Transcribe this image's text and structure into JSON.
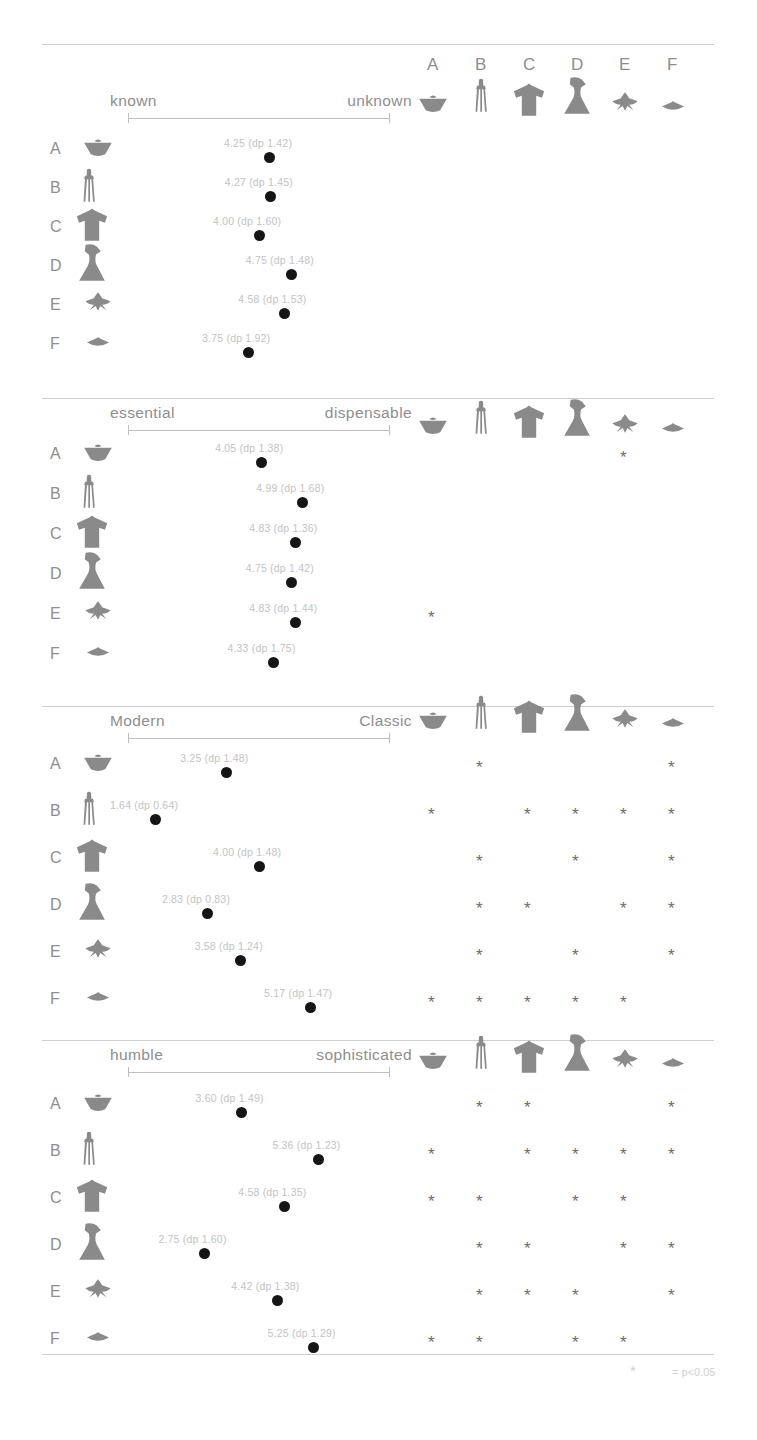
{
  "figure": {
    "categories": [
      "A",
      "B",
      "C",
      "D",
      "E",
      "F"
    ],
    "icon_names": [
      "bowl-silhouette",
      "juicer-silhouette",
      "tshirt-silhouette",
      "hourglass-silhouette",
      "bird-silhouette",
      "disc-silhouette"
    ],
    "footnote": "= p<0.05",
    "footnote_marker": "*",
    "significance_marker": "*"
  },
  "chart_data": {
    "type": "scatter",
    "title": "",
    "categories": [
      "A",
      "B",
      "C",
      "D",
      "E",
      "F"
    ],
    "xlim": [
      1,
      7
    ],
    "grid": false,
    "legend": "none",
    "panels": [
      {
        "id": "panel-known-unknown",
        "xlabel_left": "known",
        "xlabel_right": "unknown",
        "points": [
          {
            "category": "A",
            "mean": 4.25,
            "sd": 1.42,
            "label": "4.25 (dp 1.42)"
          },
          {
            "category": "B",
            "mean": 4.27,
            "sd": 1.45,
            "label": "4.27 (dp 1.45)"
          },
          {
            "category": "C",
            "mean": 4.0,
            "sd": 1.6,
            "label": "4.00 (dp 1.60)"
          },
          {
            "category": "D",
            "mean": 4.75,
            "sd": 1.48,
            "label": "4.75 (dp 1.48)"
          },
          {
            "category": "E",
            "mean": 4.58,
            "sd": 1.53,
            "label": "4.58 (dp 1.53)"
          },
          {
            "category": "F",
            "mean": 3.75,
            "sd": 1.92,
            "label": "3.75 (dp 1.92)"
          }
        ],
        "significance": {
          "A": [],
          "B": [],
          "C": [],
          "D": [],
          "E": [],
          "F": []
        }
      },
      {
        "id": "panel-essential-dispensable",
        "xlabel_left": "essential",
        "xlabel_right": "dispensable",
        "points": [
          {
            "category": "A",
            "mean": 4.05,
            "sd": 1.38,
            "label": "4.05 (dp 1.38)"
          },
          {
            "category": "B",
            "mean": 4.99,
            "sd": 1.68,
            "label": "4.99 (dp 1.68)"
          },
          {
            "category": "C",
            "mean": 4.83,
            "sd": 1.36,
            "label": "4.83 (dp 1.36)"
          },
          {
            "category": "D",
            "mean": 4.75,
            "sd": 1.42,
            "label": "4.75 (dp 1.42)"
          },
          {
            "category": "E",
            "mean": 4.83,
            "sd": 1.44,
            "label": "4.83 (dp 1.44)"
          },
          {
            "category": "F",
            "mean": 4.33,
            "sd": 1.75,
            "label": "4.33 (dp 1.75)"
          }
        ],
        "significance": {
          "A": [
            "E"
          ],
          "B": [],
          "C": [],
          "D": [],
          "E": [
            "A"
          ],
          "F": []
        }
      },
      {
        "id": "panel-modern-classic",
        "xlabel_left": "Modern",
        "xlabel_right": "Classic",
        "points": [
          {
            "category": "A",
            "mean": 3.25,
            "sd": 1.48,
            "label": "3.25 (dp 1.48)"
          },
          {
            "category": "B",
            "mean": 1.64,
            "sd": 0.64,
            "label": "1.64 (dp 0.64)"
          },
          {
            "category": "C",
            "mean": 4.0,
            "sd": 1.48,
            "label": "4.00 (dp 1.48)"
          },
          {
            "category": "D",
            "mean": 2.83,
            "sd": 0.83,
            "label": "2.83 (dp 0.83)"
          },
          {
            "category": "E",
            "mean": 3.58,
            "sd": 1.24,
            "label": "3.58 (dp 1.24)"
          },
          {
            "category": "F",
            "mean": 5.17,
            "sd": 1.47,
            "label": "5.17 (dp 1.47)"
          }
        ],
        "significance": {
          "A": [
            "B",
            "F"
          ],
          "B": [
            "A",
            "C",
            "D",
            "E",
            "F"
          ],
          "C": [
            "B",
            "D",
            "F"
          ],
          "D": [
            "B",
            "C",
            "E",
            "F"
          ],
          "E": [
            "B",
            "D",
            "F"
          ],
          "F": [
            "A",
            "B",
            "C",
            "D",
            "E"
          ]
        }
      },
      {
        "id": "panel-humble-sophisticated",
        "xlabel_left": "humble",
        "xlabel_right": "sophisticated",
        "points": [
          {
            "category": "A",
            "mean": 3.6,
            "sd": 1.49,
            "label": "3.60 (dp 1.49)"
          },
          {
            "category": "B",
            "mean": 5.36,
            "sd": 1.23,
            "label": "5.36 (dp 1.23)"
          },
          {
            "category": "C",
            "mean": 4.58,
            "sd": 1.35,
            "label": "4.58 (dp 1.35)"
          },
          {
            "category": "D",
            "mean": 2.75,
            "sd": 1.6,
            "label": "2.75 (dp 1.60)"
          },
          {
            "category": "E",
            "mean": 4.42,
            "sd": 1.38,
            "label": "4.42 (dp 1.38)"
          },
          {
            "category": "F",
            "mean": 5.25,
            "sd": 1.29,
            "label": "5.25 (dp 1.29)"
          }
        ],
        "significance": {
          "A": [
            "B",
            "C",
            "F"
          ],
          "B": [
            "A",
            "C",
            "D",
            "E",
            "F"
          ],
          "C": [
            "A",
            "B",
            "D",
            "E"
          ],
          "D": [
            "B",
            "C",
            "E",
            "F"
          ],
          "E": [
            "B",
            "C",
            "D",
            "F"
          ],
          "F": [
            "A",
            "B",
            "D",
            "E"
          ]
        }
      }
    ]
  }
}
